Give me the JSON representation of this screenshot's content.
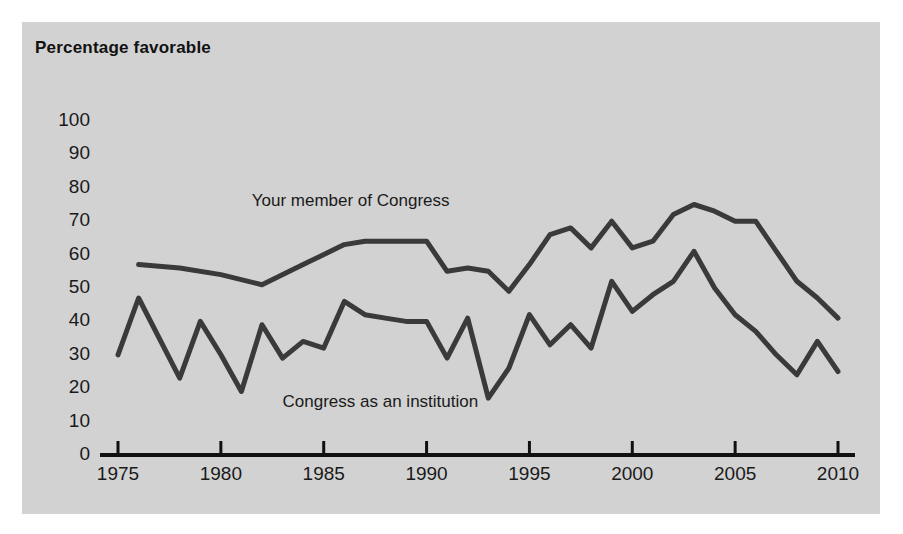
{
  "figure": {
    "title": "Percentage favorable",
    "background_color": "#d2d2d2",
    "page_color": "#ffffff",
    "line_color": "#3a3a3a",
    "axis_color": "#111111"
  },
  "chart_data": {
    "type": "line",
    "title": "Percentage favorable",
    "xlabel": "",
    "ylabel": "Percentage favorable",
    "xlim": [
      1974,
      2011
    ],
    "ylim": [
      0,
      100
    ],
    "ytick_step": 10,
    "yticks": [
      0,
      10,
      20,
      30,
      40,
      50,
      60,
      70,
      80,
      90,
      100
    ],
    "xticks": [
      1975,
      1980,
      1985,
      1990,
      1995,
      2000,
      2005,
      2010
    ],
    "xtick_labels": [
      "1975",
      "1980",
      "1985",
      "1990",
      "1995",
      "2000",
      "2005",
      "2010"
    ],
    "ytick_labels": [
      "0",
      "10",
      "20",
      "30",
      "40",
      "50",
      "60",
      "70",
      "80",
      "90",
      "100"
    ],
    "grid": false,
    "legend": "inline-labels",
    "series": [
      {
        "name": "Your member of Congress",
        "label_x": 1981.5,
        "label_y": 76,
        "x": [
          1976,
          1978,
          1980,
          1982,
          1984,
          1986,
          1987,
          1988,
          1990,
          1991,
          1992,
          1993,
          1994,
          1995,
          1996,
          1997,
          1998,
          1999,
          2000,
          2001,
          2002,
          2003,
          2004,
          2005,
          2006,
          2007,
          2008,
          2009,
          2010
        ],
        "values": [
          57,
          56,
          54,
          51,
          57,
          63,
          64,
          64,
          64,
          55,
          56,
          55,
          49,
          57,
          66,
          68,
          62,
          70,
          62,
          64,
          72,
          75,
          73,
          70,
          70,
          61,
          52,
          47,
          41
        ]
      },
      {
        "name": "Congress as an institution",
        "label_x": 1983.0,
        "label_y": 16,
        "x": [
          1975,
          1976,
          1978,
          1979,
          1980,
          1981,
          1982,
          1983,
          1984,
          1985,
          1986,
          1987,
          1988,
          1989,
          1990,
          1991,
          1992,
          1993,
          1994,
          1995,
          1996,
          1997,
          1998,
          1999,
          2000,
          2001,
          2002,
          2003,
          2004,
          2005,
          2006,
          2007,
          2008,
          2009,
          2010
        ],
        "values": [
          30,
          47,
          23,
          40,
          30,
          19,
          39,
          29,
          34,
          32,
          46,
          42,
          41,
          40,
          40,
          29,
          41,
          17,
          26,
          42,
          33,
          39,
          32,
          52,
          43,
          48,
          52,
          61,
          50,
          42,
          37,
          30,
          24,
          34,
          25
        ]
      }
    ]
  },
  "axes": {
    "y_values": [
      "100",
      "90",
      "80",
      "70",
      "60",
      "50",
      "40",
      "30",
      "20",
      "10",
      "0"
    ],
    "x_values": [
      "1975",
      "1980",
      "1985",
      "1990",
      "1995",
      "2000",
      "2005",
      "2010"
    ]
  },
  "series_labels": {
    "upper": "Your member of Congress",
    "lower": "Congress as an institution"
  }
}
